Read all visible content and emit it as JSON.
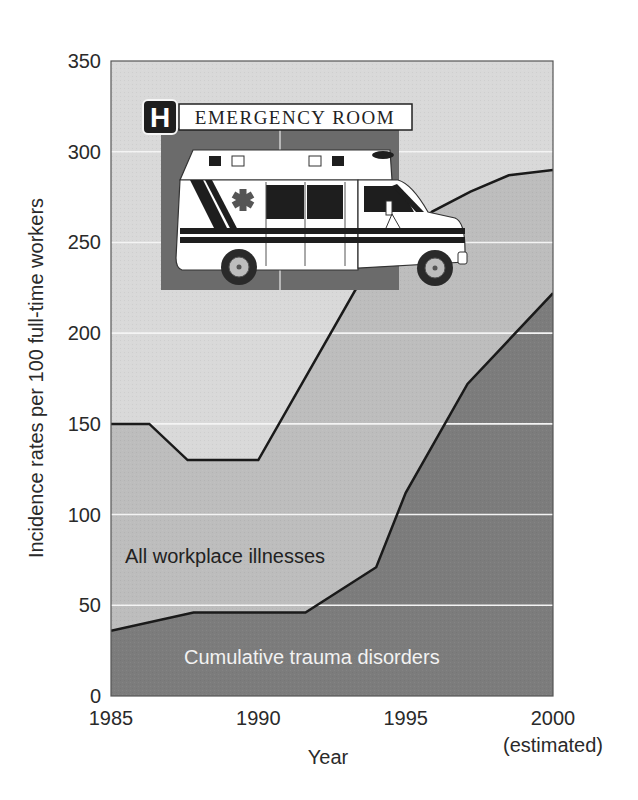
{
  "chart_data": {
    "type": "area",
    "title": "",
    "xlabel": "Year",
    "ylabel": "Incidence rates per 100 full-time workers",
    "x_tick_labels": [
      "1985",
      "1990",
      "1995",
      "2000"
    ],
    "x_tick_note": "(estimated)",
    "y_tick_labels": [
      "0",
      "50",
      "100",
      "150",
      "200",
      "250",
      "300",
      "350"
    ],
    "xlim": [
      1985,
      2000
    ],
    "ylim": [
      0,
      350
    ],
    "grid": "horizontal, white lines at every 50",
    "legend": "none (inline region labels)",
    "series": [
      {
        "name": "All workplace illnesses",
        "fill": "#bdbdbd",
        "x": [
          1985,
          1986.3,
          1987.6,
          1990,
          1993.3,
          1995.9,
          1997.2,
          1998.5,
          2000
        ],
        "values": [
          150,
          150,
          130,
          130,
          224,
          267,
          278,
          287,
          290
        ]
      },
      {
        "name": "Cumulative trauma disorders",
        "fill": "#7c7c7c",
        "x": [
          1985,
          1987.8,
          1991.6,
          1994,
          1995,
          1997.1,
          2000
        ],
        "values": [
          36,
          46,
          46,
          71,
          112,
          172,
          222
        ]
      }
    ],
    "annotations": [
      "All workplace illnesses",
      "Cumulative trauma disorders"
    ],
    "background_fill": "#d9d9d9"
  },
  "illustration": {
    "sign_letter": "H",
    "sign_text": "EMERGENCY ROOM",
    "subject": "ambulance"
  }
}
